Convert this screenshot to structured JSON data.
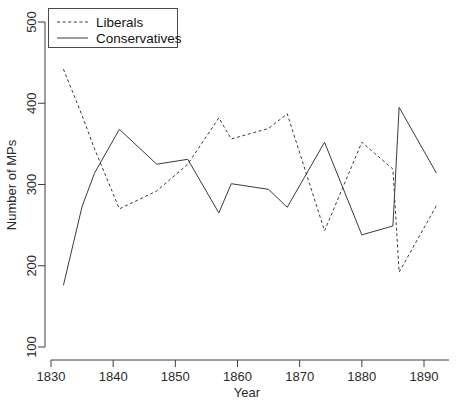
{
  "chart_data": {
    "type": "line",
    "title": "",
    "xlabel": "Year",
    "ylabel": "Number of MPs",
    "xlim": [
      1830,
      1894
    ],
    "ylim": [
      100,
      500
    ],
    "xticks": [
      1830,
      1840,
      1850,
      1860,
      1870,
      1880,
      1890
    ],
    "yticks": [
      100,
      200,
      300,
      400,
      500
    ],
    "xtick_labels": [
      "1830",
      "1840",
      "1850",
      "1860",
      "1870",
      "1880",
      "1890"
    ],
    "ytick_labels": [
      "100",
      "200",
      "300",
      "400",
      "500"
    ],
    "grid": false,
    "legend_position": "top-left",
    "series": [
      {
        "name": "Liberals",
        "style": "dashed",
        "color": "#3a3a3a",
        "x": [
          1832,
          1835,
          1837,
          1841,
          1847,
          1852,
          1857,
          1859,
          1865,
          1868,
          1874,
          1880,
          1885,
          1886,
          1892
        ],
        "values": [
          442,
          385,
          344,
          270,
          292,
          325,
          382,
          356,
          369,
          387,
          243,
          352,
          319,
          192,
          274
        ]
      },
      {
        "name": "Conservatives",
        "style": "solid",
        "color": "#3a3a3a",
        "x": [
          1832,
          1835,
          1837,
          1841,
          1847,
          1852,
          1857,
          1859,
          1865,
          1868,
          1874,
          1880,
          1885,
          1886,
          1892
        ],
        "values": [
          176,
          273,
          314,
          368,
          325,
          331,
          265,
          301,
          294,
          272,
          352,
          238,
          249,
          395,
          314
        ]
      }
    ]
  },
  "legend": {
    "entries": [
      {
        "label": "Liberals"
      },
      {
        "label": "Conservatives"
      }
    ]
  },
  "axes": {
    "x_title": "Year",
    "y_title": "Number of MPs"
  }
}
